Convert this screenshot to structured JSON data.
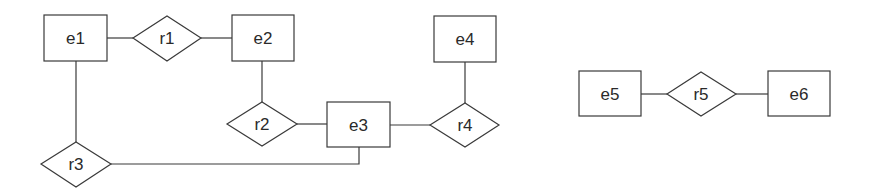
{
  "diagram": {
    "type": "entity-relationship",
    "entities": [
      {
        "id": "e1",
        "label": "e1",
        "x": 44,
        "y": 15,
        "w": 63,
        "h": 46
      },
      {
        "id": "e2",
        "label": "e2",
        "x": 232,
        "y": 15,
        "w": 62,
        "h": 46
      },
      {
        "id": "e3",
        "label": "e3",
        "x": 327,
        "y": 102,
        "w": 63,
        "h": 45
      },
      {
        "id": "e4",
        "label": "e4",
        "x": 434,
        "y": 16,
        "w": 62,
        "h": 46
      },
      {
        "id": "e5",
        "label": "e5",
        "x": 579,
        "y": 71,
        "w": 62,
        "h": 45
      },
      {
        "id": "e6",
        "label": "e6",
        "x": 768,
        "y": 71,
        "w": 62,
        "h": 45
      }
    ],
    "relationships": [
      {
        "id": "r1",
        "label": "r1",
        "cx": 167,
        "cy": 38,
        "w": 68,
        "h": 45
      },
      {
        "id": "r2",
        "label": "r2",
        "cx": 262,
        "cy": 124,
        "w": 70,
        "h": 44
      },
      {
        "id": "r3",
        "label": "r3",
        "cx": 76,
        "cy": 164,
        "w": 70,
        "h": 45
      },
      {
        "id": "r4",
        "label": "r4",
        "cx": 465,
        "cy": 125,
        "w": 69,
        "h": 44
      },
      {
        "id": "r5",
        "label": "r5",
        "cx": 701,
        "cy": 94,
        "w": 69,
        "h": 45
      }
    ],
    "edges": [
      {
        "from": "e1",
        "to": "r1"
      },
      {
        "from": "r1",
        "to": "e2"
      },
      {
        "from": "e2",
        "to": "r2"
      },
      {
        "from": "r2",
        "to": "e3"
      },
      {
        "from": "e3",
        "to": "r4"
      },
      {
        "from": "e4",
        "to": "r4"
      },
      {
        "from": "e1",
        "to": "r3"
      },
      {
        "from": "r3",
        "to": "e3"
      },
      {
        "from": "e5",
        "to": "r5"
      },
      {
        "from": "r5",
        "to": "e6"
      }
    ]
  }
}
